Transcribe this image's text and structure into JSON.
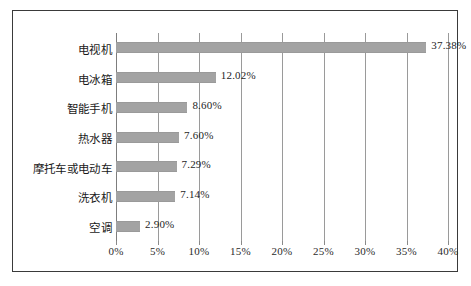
{
  "chart_data": {
    "type": "bar",
    "orientation": "horizontal",
    "title": "",
    "subtitle": "",
    "xlabel": "",
    "ylabel": "",
    "categories": [
      "电视机",
      "电冰箱",
      "智能手机",
      "热水器",
      "摩托车或电动车",
      "洗衣机",
      "空调"
    ],
    "values": [
      37.38,
      12.02,
      8.6,
      7.6,
      7.29,
      7.14,
      2.9
    ],
    "value_labels": [
      "37.38%",
      "12.02%",
      "8.60%",
      "7.60%",
      "7.29%",
      "7.14%",
      "2.90%"
    ],
    "xlim": [
      0,
      40
    ],
    "xticks": [
      0,
      5,
      10,
      15,
      20,
      25,
      30,
      35,
      40
    ],
    "xtick_labels": [
      "0%",
      "5%",
      "10%",
      "15%",
      "20%",
      "25%",
      "30%",
      "35%",
      "40%"
    ],
    "grid": true,
    "grid_axis": "x",
    "legend": null,
    "bar_color": "#a3a3a3",
    "frame_color": "#3a3a3a",
    "gridline_color": "#9a9a9a",
    "text_color": "#1a1a1a"
  }
}
